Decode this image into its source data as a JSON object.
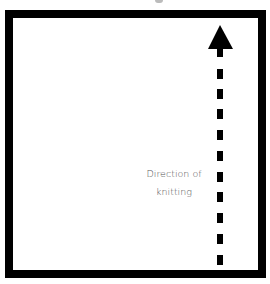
{
  "diagram": {
    "label_line1": "Direction of",
    "label_line2": "knitting",
    "frame_color": "#000000",
    "arrow_color": "#000000",
    "label_color": "#555555",
    "arrow_direction": "up",
    "arrow_style": "dashed"
  }
}
